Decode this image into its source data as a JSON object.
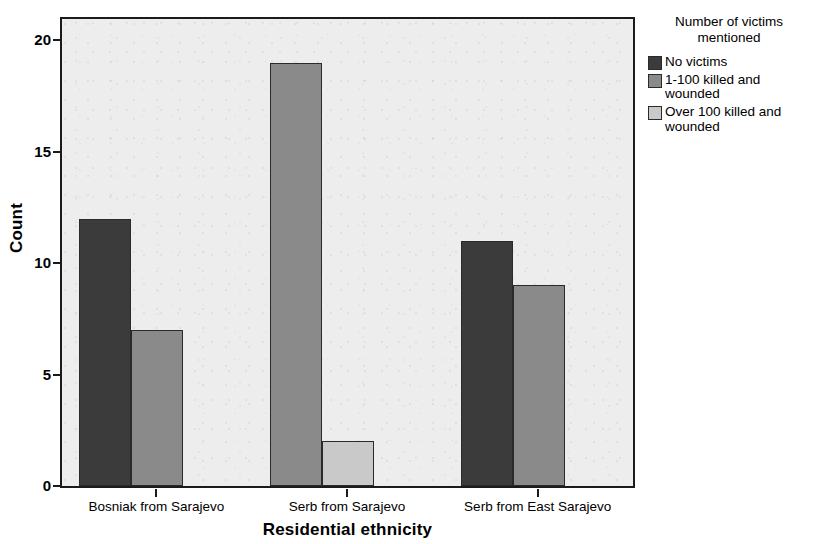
{
  "chart_data": {
    "type": "bar",
    "title": "",
    "xlabel": "Residential ethnicity",
    "ylabel": "Count",
    "categories": [
      "Bosniak from Sarajevo",
      "Serb from Sarajevo",
      "Serb from East Sarajevo"
    ],
    "series": [
      {
        "name": "No victims",
        "color": "#3b3b3b",
        "values": [
          12,
          0,
          11
        ]
      },
      {
        "name": "1-100 killed and wounded",
        "color": "#8a8a8a",
        "values": [
          7,
          19,
          9
        ]
      },
      {
        "name": "Over 100 killed and wounded",
        "color": "#c9c9c9",
        "values": [
          0,
          2,
          0
        ]
      }
    ],
    "ylim": [
      0,
      21
    ],
    "yticks": [
      0,
      5,
      10,
      15,
      20
    ],
    "ytick_labels": [
      "0",
      "5",
      "10",
      "15",
      "20"
    ],
    "grid": false,
    "legend_position": "right",
    "legend_title": "Number of victims mentioned"
  },
  "axes": {
    "y_title": "Count",
    "x_title": "Residential ethnicity",
    "y_tick_labels": [
      "20",
      "15",
      "10",
      "5",
      "0"
    ],
    "x_tick_labels": [
      "Bosniak from Sarajevo",
      "Serb from Sarajevo",
      "Serb from East Sarajevo"
    ]
  },
  "legend": {
    "title_line1": "Number of victims",
    "title_line2": "mentioned",
    "items": [
      {
        "label": "No victims",
        "color": "#3b3b3b"
      },
      {
        "label": "1-100 killed and wounded",
        "color": "#8a8a8a"
      },
      {
        "label": "Over 100 killed and wounded",
        "color": "#c9c9c9"
      }
    ]
  },
  "colors": {
    "plot_background": "#ededed",
    "axis": "#1b1b1b",
    "page_background": "#ffffff"
  }
}
